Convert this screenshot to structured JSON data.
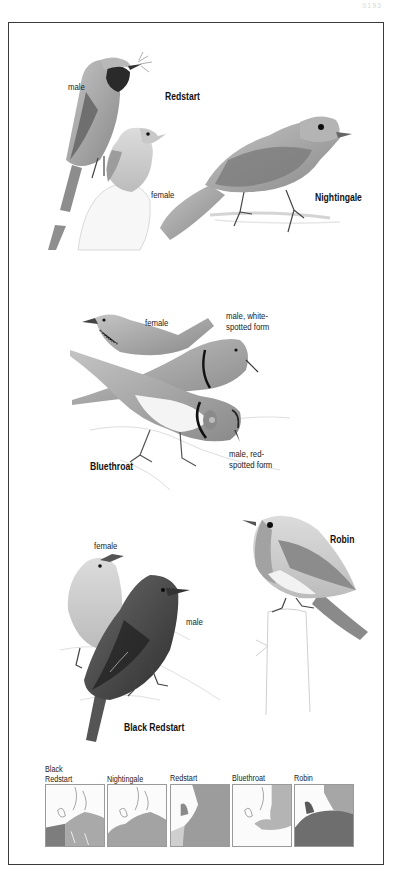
{
  "page": {
    "page_number": "0193"
  },
  "plates": [
    {
      "species": "Redstart",
      "labels": {
        "male": "male",
        "female": "female"
      }
    },
    {
      "species": "Nightingale",
      "labels": {}
    },
    {
      "species": "Bluethroat",
      "labels": {
        "female": "female",
        "male_white_line1": "male, white-",
        "male_white_line2": "spotted form",
        "male_red_line1": "male, red-",
        "male_red_line2": "spotted form"
      }
    },
    {
      "species": "Robin",
      "labels": {}
    },
    {
      "species": "Black Redstart",
      "labels": {
        "female": "female",
        "male": "male"
      }
    }
  ],
  "range_maps": [
    {
      "label_line1": "Black",
      "label_line2": "Redstart",
      "shade": "#7d7d7d",
      "shade2": "#a9a9a9"
    },
    {
      "label_line1": "",
      "label_line2": "Nightingale",
      "shade": "#a3a3a3",
      "shade2": "#a3a3a3"
    },
    {
      "label_line1": "",
      "label_line2": "Redstart",
      "shade": "#9c9c9c",
      "shade2": "#cfcfcf"
    },
    {
      "label_line1": "",
      "label_line2": "Bluethroat",
      "shade": "#b4b4b4",
      "shade2": "#ffffff"
    },
    {
      "label_line1": "",
      "label_line2": "Robin",
      "shade": "#6e6e6e",
      "shade2": "#a6a6a6"
    }
  ],
  "colors": {
    "frame": "#3a3a3a",
    "ink": "#222222",
    "bird_mid": "#9a9a9a",
    "bird_dark": "#4a4a4a",
    "bird_light": "#d6d6d6"
  }
}
